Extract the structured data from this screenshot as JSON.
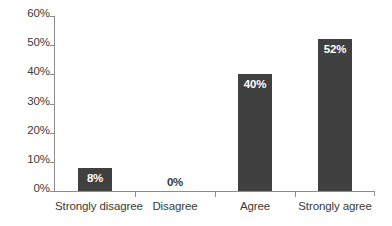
{
  "chart_data": {
    "type": "bar",
    "title": "",
    "subtitle": "",
    "xlabel": "",
    "ylabel": "",
    "categories": [
      "Strongly disagree",
      "Disagree",
      "Agree",
      "Strongly agree"
    ],
    "values": [
      8,
      0,
      40,
      52
    ],
    "value_labels": [
      "8%",
      "0%",
      "40%",
      "52%"
    ],
    "ylim": [
      0,
      60
    ],
    "ytick_values": [
      0,
      10,
      20,
      30,
      40,
      50,
      60
    ],
    "ytick_labels": [
      "0%",
      "10%",
      "20%",
      "30%",
      "40%",
      "50%",
      "60%"
    ],
    "grid": false,
    "legend": false,
    "legend_position": "none",
    "colors": {
      "bar": "#404040",
      "background": "#ffffff",
      "axis": "#8c8c8c",
      "text": "#3a3a3a",
      "inside_label_text": "#ffffff"
    }
  }
}
